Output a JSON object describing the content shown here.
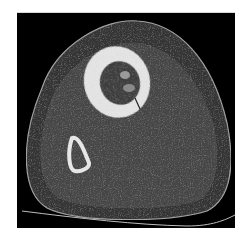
{
  "image": {
    "kind": "axial CT slice",
    "description": "Cross-sectional CT scan of a lower leg showing a large tibia with a lytic medullary lesion and a small fibula",
    "colors": {
      "background": "#000000",
      "skin_outline": "#9a9a9a",
      "subcutaneous_fat": "#3a3a3a",
      "muscle": "#4a4a4a",
      "cortical_bone": "#e8e8e8",
      "marrow_lesion": "#3c3c3c",
      "table_line": "#bdbdbd",
      "page": "#ffffff"
    }
  }
}
